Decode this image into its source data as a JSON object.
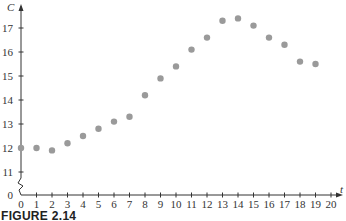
{
  "chart_data": {
    "type": "scatter",
    "title": "",
    "caption": "FIGURE 2.14",
    "xlabel": "t",
    "ylabel": "C",
    "x": [
      0,
      1,
      2,
      3,
      4,
      5,
      6,
      7,
      8,
      9,
      10,
      11,
      12,
      13,
      14,
      15,
      16,
      17,
      18,
      19
    ],
    "series": [
      {
        "name": "C",
        "values": [
          12.0,
          12.0,
          11.9,
          12.2,
          12.5,
          12.8,
          13.1,
          13.3,
          14.2,
          14.9,
          15.4,
          16.1,
          16.6,
          17.3,
          17.4,
          17.1,
          16.6,
          16.3,
          15.6,
          15.5
        ]
      }
    ],
    "xticks": [
      0,
      1,
      2,
      3,
      4,
      5,
      6,
      7,
      8,
      9,
      10,
      11,
      12,
      13,
      14,
      15,
      16,
      17,
      18,
      19,
      20
    ],
    "yticks": [
      0,
      11,
      12,
      13,
      14,
      15,
      16,
      17
    ],
    "xlim": [
      0,
      20
    ],
    "ylim_broken": {
      "lower": [
        0,
        0
      ],
      "upper": [
        11,
        17.6
      ]
    },
    "axis_break": true,
    "grid": false,
    "legend": "none",
    "marker_color": "#9a9a9a",
    "axis_color": "#333333"
  }
}
